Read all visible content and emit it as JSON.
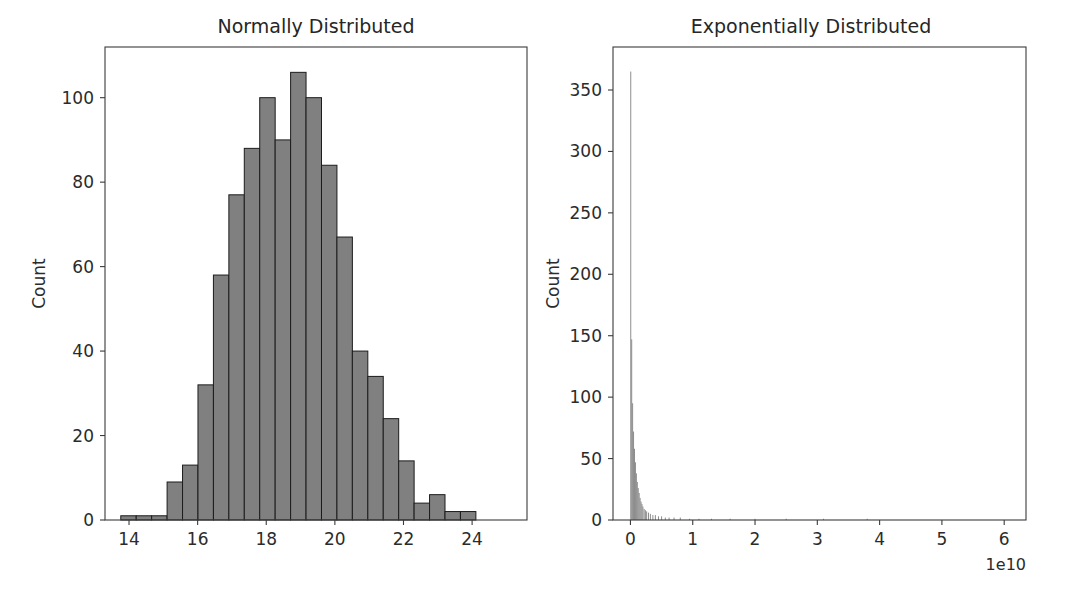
{
  "figure": {
    "background": "#ffffff",
    "width": 1067,
    "height": 606,
    "bar_fill_color": "#808080",
    "bar_edge_color": "#1c1c1c",
    "axis_color": "#3b3b3b",
    "text_color": "#262626"
  },
  "chart_data": [
    {
      "type": "bar",
      "id": "normal-histogram",
      "title": "Normally Distributed",
      "xlabel": "",
      "ylabel": "Count",
      "grid": false,
      "legend": false,
      "xlim": [
        13.3,
        25.6
      ],
      "ylim": [
        0,
        112
      ],
      "xticks": [
        14,
        16,
        18,
        20,
        22,
        24
      ],
      "xtick_labels": [
        "14",
        "16",
        "18",
        "20",
        "22",
        "24"
      ],
      "yticks": [
        0,
        20,
        40,
        60,
        80,
        100
      ],
      "ytick_labels": [
        "0",
        "20",
        "40",
        "60",
        "80",
        "100"
      ],
      "bin_edges": [
        13.76,
        14.21,
        14.66,
        15.11,
        15.56,
        16.01,
        16.46,
        16.91,
        17.36,
        17.81,
        18.26,
        18.71,
        19.16,
        19.61,
        20.06,
        20.51,
        20.96,
        21.41,
        21.86,
        22.31,
        22.76,
        23.21,
        23.66,
        24.11,
        24.56,
        25.01
      ],
      "values": [
        1,
        1,
        1,
        9,
        13,
        32,
        58,
        77,
        88,
        100,
        90,
        106,
        100,
        84,
        67,
        40,
        34,
        24,
        14,
        4,
        6,
        2,
        2
      ],
      "bin_centers": [
        13.98,
        14.43,
        14.88,
        15.33,
        15.78,
        16.23,
        16.68,
        17.13,
        17.58,
        18.03,
        18.48,
        18.93,
        19.38,
        19.83,
        20.28,
        20.73,
        21.18,
        21.63,
        22.08,
        22.53,
        22.98,
        23.43,
        23.88
      ]
    },
    {
      "type": "bar",
      "id": "exponential-histogram",
      "title": "Exponentially Distributed",
      "xlabel": "",
      "ylabel": "Count",
      "grid": false,
      "legend": false,
      "x_offset_text": "1e10",
      "x_offset_multiplier": 10000000000,
      "xlim": [
        -0.28,
        6.35
      ],
      "ylim": [
        0,
        385
      ],
      "xticks": [
        0,
        1,
        2,
        3,
        4,
        5,
        6
      ],
      "xtick_labels": [
        "0",
        "1",
        "2",
        "3",
        "4",
        "5",
        "6"
      ],
      "yticks": [
        0,
        50,
        100,
        150,
        200,
        250,
        300,
        350
      ],
      "ytick_labels": [
        "0",
        "50",
        "100",
        "150",
        "200",
        "250",
        "300",
        "350"
      ],
      "bin_centers": [
        0.005,
        0.02,
        0.035,
        0.05,
        0.065,
        0.08,
        0.095,
        0.11,
        0.125,
        0.14,
        0.155,
        0.17,
        0.185,
        0.2,
        0.22,
        0.24,
        0.26,
        0.29,
        0.32,
        0.36,
        0.4,
        0.45,
        0.5,
        0.56,
        0.62,
        0.7,
        0.8,
        0.95,
        1.1,
        1.3,
        1.6,
        2.0,
        2.5,
        3.1,
        3.8,
        4.6,
        5.5
      ],
      "values": [
        365,
        147,
        95,
        72,
        58,
        47,
        38,
        31,
        26,
        22,
        18,
        15,
        13,
        11,
        9,
        8,
        7,
        6,
        5,
        4,
        4,
        3,
        3,
        2,
        2,
        2,
        2,
        1,
        1,
        1,
        1,
        1,
        1,
        1,
        1,
        0,
        0
      ],
      "bin_width": 0.0155
    }
  ]
}
